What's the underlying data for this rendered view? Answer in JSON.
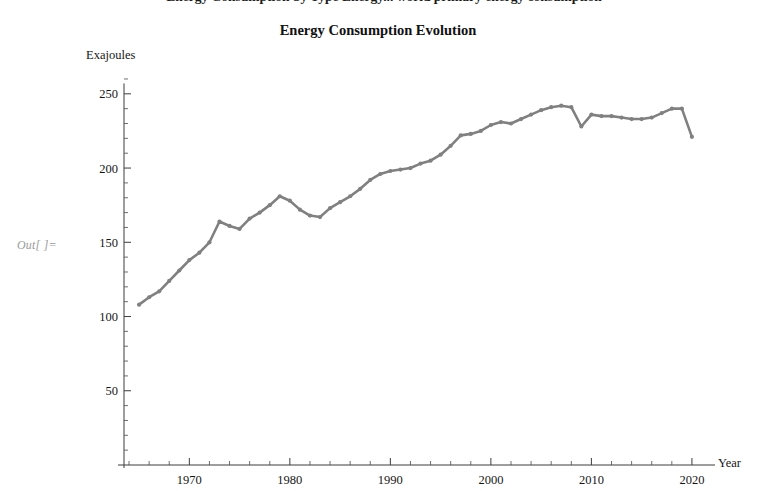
{
  "notebook": {
    "out_label": "Out[ ]=",
    "clipped_header_text": "Energy Consumption by Type Energy... world primary energy consumption"
  },
  "chart_data": {
    "type": "line",
    "title": "Energy Consumption Evolution",
    "xlabel": "Year",
    "ylabel": "Exajoules",
    "xlim": [
      1963.5,
      2021.5
    ],
    "ylim": [
      0,
      262
    ],
    "grid": false,
    "legend": null,
    "line_color": "#808080",
    "marker": "point",
    "y_major_ticks": [
      50,
      100,
      150,
      200,
      250
    ],
    "y_minor_step": 10,
    "x_major_ticks": [
      1970,
      1980,
      1990,
      2000,
      2010,
      2020
    ],
    "x_minor_step": 2,
    "x_major_tick_labels": [
      "1970",
      "1980",
      "1990",
      "2000",
      "2010",
      "2020"
    ],
    "y_major_tick_labels": [
      "50",
      "100",
      "150",
      "200",
      "250"
    ],
    "x": [
      1965,
      1966,
      1967,
      1968,
      1969,
      1970,
      1971,
      1972,
      1973,
      1974,
      1975,
      1976,
      1977,
      1978,
      1979,
      1980,
      1981,
      1982,
      1983,
      1984,
      1985,
      1986,
      1987,
      1988,
      1989,
      1990,
      1991,
      1992,
      1993,
      1994,
      1995,
      1996,
      1997,
      1998,
      1999,
      2000,
      2001,
      2002,
      2003,
      2004,
      2005,
      2006,
      2007,
      2008,
      2009,
      2010,
      2011,
      2012,
      2013,
      2014,
      2015,
      2016,
      2017,
      2018,
      2019,
      2020
    ],
    "y": [
      108,
      113,
      117,
      124,
      131,
      138,
      143,
      150,
      164,
      161,
      159,
      166,
      170,
      175,
      181,
      178,
      172,
      168,
      167,
      173,
      177,
      181,
      186,
      192,
      196,
      198,
      199,
      200,
      203,
      205,
      209,
      215,
      222,
      223,
      225,
      229,
      231,
      230,
      233,
      236,
      239,
      241,
      242,
      241,
      228,
      236,
      235,
      235,
      234,
      233,
      233,
      234,
      237,
      240,
      240,
      221
    ]
  }
}
